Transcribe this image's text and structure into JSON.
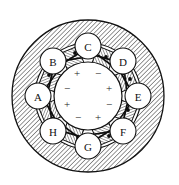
{
  "figure": {
    "name": "electrical-machine-cross-section"
  },
  "geometry": {
    "canvas": {
      "width": 179,
      "height": 185
    },
    "center": {
      "x": 88,
      "y": 96
    },
    "outer_circle_radius": 76,
    "stator_inner_radius": 53,
    "bore_circle_radius": 34,
    "pole_circle_radius": 13,
    "pole_ring_radius": 50
  },
  "colors": {
    "ink": "#111111",
    "hatch": "#3a3a3a",
    "background": "#ffffff",
    "fill_light": "#fdfdfd"
  },
  "poles": [
    {
      "id": "pole-a",
      "label": "A",
      "angle_deg": 180,
      "cx": 38,
      "cy": 96
    },
    {
      "id": "pole-b",
      "label": "B",
      "angle_deg": 225,
      "cx": 53,
      "cy": 61
    },
    {
      "id": "pole-c",
      "label": "C",
      "angle_deg": 270,
      "cx": 88,
      "cy": 46
    },
    {
      "id": "pole-d",
      "label": "D",
      "angle_deg": 315,
      "cx": 123,
      "cy": 61
    },
    {
      "id": "pole-e",
      "label": "E",
      "angle_deg": 0,
      "cx": 138,
      "cy": 96
    },
    {
      "id": "pole-f",
      "label": "F",
      "angle_deg": 45,
      "cx": 123,
      "cy": 131
    },
    {
      "id": "pole-g",
      "label": "G",
      "angle_deg": 90,
      "cx": 88,
      "cy": 146
    },
    {
      "id": "pole-h",
      "label": "H",
      "angle_deg": 135,
      "cx": 53,
      "cy": 131
    }
  ],
  "polarity_marks": [
    {
      "id": "sign-1",
      "symbol": "+",
      "cx": 77,
      "cy": 73,
      "angle_deg": 247.5
    },
    {
      "id": "sign-2",
      "symbol": "−",
      "cx": 98,
      "cy": 73,
      "angle_deg": 292.5
    },
    {
      "id": "sign-3",
      "symbol": "+",
      "cx": 109,
      "cy": 88,
      "angle_deg": 337.5
    },
    {
      "id": "sign-4",
      "symbol": "−",
      "cx": 109,
      "cy": 104,
      "angle_deg": 22.5
    },
    {
      "id": "sign-5",
      "symbol": "+",
      "cx": 98,
      "cy": 117,
      "angle_deg": 67.5
    },
    {
      "id": "sign-6",
      "symbol": "−",
      "cx": 78,
      "cy": 117,
      "angle_deg": 112.5
    },
    {
      "id": "sign-7",
      "symbol": "+",
      "cx": 67,
      "cy": 104,
      "angle_deg": 157.5
    },
    {
      "id": "sign-8",
      "symbol": "−",
      "cx": 67,
      "cy": 88,
      "angle_deg": 202.5
    }
  ],
  "slots": [
    {
      "id": "slot-1",
      "angle_deg": 247.5
    },
    {
      "id": "slot-2",
      "angle_deg": 292.5
    },
    {
      "id": "slot-3",
      "angle_deg": 337.5
    },
    {
      "id": "slot-4",
      "angle_deg": 22.5
    },
    {
      "id": "slot-5",
      "angle_deg": 67.5
    },
    {
      "id": "slot-6",
      "angle_deg": 112.5
    },
    {
      "id": "slot-7",
      "angle_deg": 157.5
    },
    {
      "id": "slot-8",
      "angle_deg": 202.5
    }
  ],
  "winding_polygons": [
    {
      "id": "winding-outer",
      "rotation_deg": -8,
      "radius": 45,
      "sides": 8,
      "stroke_width": 1.8
    },
    {
      "id": "winding-inner",
      "rotation_deg": 14,
      "radius": 42,
      "sides": 8,
      "stroke_width": 1.6
    }
  ]
}
